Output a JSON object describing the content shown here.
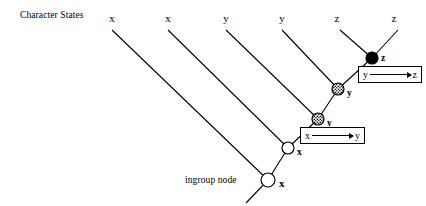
{
  "figure": {
    "header_label": "Character States",
    "ingroup_label": "ingroup node",
    "background_color": "#ffffff",
    "line_color": "#000000"
  },
  "tips": [
    {
      "label": "x",
      "x": 112,
      "y": 13
    },
    {
      "label": "x",
      "x": 168,
      "y": 13
    },
    {
      "label": "y",
      "x": 226,
      "y": 13
    },
    {
      "label": "y",
      "x": 282,
      "y": 13
    },
    {
      "label": "z",
      "x": 337,
      "y": 13
    },
    {
      "label": "z",
      "x": 394,
      "y": 13
    }
  ],
  "nodes": [
    {
      "name": "black-node-z",
      "state": "z",
      "fill": "solid-black",
      "cx": 372,
      "cy": 58,
      "r": 6,
      "label_x": 381,
      "label_y": 54
    },
    {
      "name": "hatched-node-y-upper",
      "state": "y",
      "fill": "hatched",
      "cx": 338,
      "cy": 89,
      "r": 6,
      "label_x": 347,
      "label_y": 89
    },
    {
      "name": "hatched-node-y-lower",
      "state": "y",
      "fill": "hatched",
      "cx": 318,
      "cy": 119,
      "r": 6,
      "label_x": 327,
      "label_y": 119
    },
    {
      "name": "white-node-x",
      "state": "x",
      "fill": "white",
      "cx": 288,
      "cy": 148,
      "r": 6,
      "label_x": 297,
      "label_y": 148
    },
    {
      "name": "ingroup-node-x",
      "state": "x",
      "fill": "white",
      "cx": 268,
      "cy": 180,
      "r": 7,
      "label_x": 279,
      "label_y": 178
    }
  ],
  "changes": [
    {
      "name": "change-y-to-z",
      "from": "y",
      "to": "z",
      "x": 358,
      "y": 66,
      "w": 64,
      "h": 17
    },
    {
      "name": "change-x-to-y",
      "from": "x",
      "to": "y",
      "x": 300,
      "y": 127,
      "w": 65,
      "h": 17
    }
  ],
  "branches": [
    {
      "name": "branch-tip-1",
      "x1": 112,
      "y1": 30,
      "x2": 268,
      "y2": 180
    },
    {
      "name": "branch-tip-2",
      "x1": 168,
      "y1": 30,
      "x2": 288,
      "y2": 148
    },
    {
      "name": "branch-tip-3",
      "x1": 226,
      "y1": 30,
      "x2": 318,
      "y2": 119
    },
    {
      "name": "branch-tip-4",
      "x1": 282,
      "y1": 30,
      "x2": 338,
      "y2": 89
    },
    {
      "name": "branch-tip-5",
      "x1": 340,
      "y1": 30,
      "x2": 372,
      "y2": 58
    },
    {
      "name": "branch-tip-6",
      "x1": 398,
      "y1": 30,
      "x2": 372,
      "y2": 58
    },
    {
      "name": "branch-internal-1",
      "x1": 372,
      "y1": 58,
      "x2": 338,
      "y2": 89
    },
    {
      "name": "branch-internal-2",
      "x1": 338,
      "y1": 89,
      "x2": 318,
      "y2": 119
    },
    {
      "name": "branch-internal-3",
      "x1": 318,
      "y1": 119,
      "x2": 288,
      "y2": 148
    },
    {
      "name": "branch-internal-4",
      "x1": 288,
      "y1": 148,
      "x2": 268,
      "y2": 180
    },
    {
      "name": "branch-root",
      "x1": 268,
      "y1": 180,
      "x2": 246,
      "y2": 203
    }
  ],
  "header_position": {
    "x": 20,
    "y": 11
  },
  "ingroup_position": {
    "x": 185,
    "y": 176
  }
}
